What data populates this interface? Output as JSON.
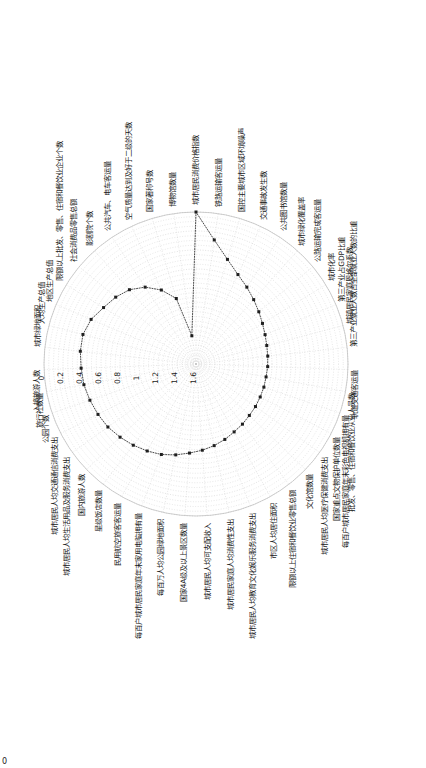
{
  "figure": {
    "corner_label": "0",
    "background": "#ffffff",
    "series_color": "#1f1f1f",
    "grid_color": "#c9c9c9"
  },
  "chart_data": {
    "type": "line",
    "subtype": "radar-polar",
    "title": "",
    "xlabel": "",
    "ylabel": "",
    "grid": true,
    "legend": null,
    "orientation_deg": 90,
    "radial_axis_reversed": true,
    "rlim": [
      0,
      1.6
    ],
    "rticks": [
      0,
      0.2,
      0.4,
      0.6,
      0.8,
      1,
      1.2,
      1.4,
      1.6
    ],
    "rtick_labels": [
      "0",
      "0.2",
      "0.4",
      "0.6",
      "0.8",
      "1",
      "1.2",
      "1.4",
      "1.6"
    ],
    "categories": [
      "城市居民消费价格指数",
      "铁路运输客运量",
      "国控主要城市区域环境噪声",
      "交通事故发生数",
      "公共图书馆数量",
      "城市绿化覆盖率",
      "公路运输完成客运量",
      "城市化率",
      "第三产业占GDP比重",
      "城镇居民家庭恩格尔系数",
      "第三产业就业人数占全部就业人数的比重",
      "轨道交通客运量",
      "批发、零售、住宿和餐饮业从业人员数",
      "每百户城市居民家庭年末彩色电视机拥有量",
      "国家重点文物保护单位数量",
      "城市居民人均医疗保健消费支出",
      "文化馆数量",
      "限额以上住宿和餐饮业零售总额",
      "市区人均居住面积",
      "城市居民人均教育文化娱乐服务消费支出",
      "城市居民家庭人均消费性支出",
      "城市居民人均可支配收入",
      "国家4A级及以上景区数量",
      "每百万人均公园绿地面积",
      "每百户城市居民家庭年末家用电脑拥有量",
      "民用航空旅客客运量",
      "星级饭店数量",
      "国内旅游人数",
      "城市居民人均生活用品及服务消费支出",
      "城市居民人均交通通信消费支出",
      "公园个数",
      "旅行社数量",
      "入境旅游人数",
      "城市绿地面积",
      "人均生产总值",
      "地区生产总值",
      "限额以上批发、零售、住宿和餐饮业企业个数",
      "社会消费品零售总额",
      "影剧院个数",
      "公共汽车、电车客运量",
      "空气质量达到及好于二级的天数",
      "国家著称号数",
      "博物馆数量"
    ],
    "values": [
      0.0,
      0.28,
      0.45,
      0.56,
      0.63,
      0.69,
      0.74,
      0.78,
      0.81,
      0.83,
      0.84,
      0.845,
      0.85,
      0.845,
      0.84,
      0.83,
      0.82,
      0.8,
      0.78,
      0.75,
      0.72,
      0.69,
      0.66,
      0.62,
      0.58,
      0.55,
      0.52,
      0.49,
      0.46,
      0.44,
      0.42,
      0.4,
      0.39,
      0.375,
      0.37,
      0.4,
      0.46,
      0.5,
      0.55,
      0.63,
      0.74,
      0.88,
      1.3
    ]
  }
}
